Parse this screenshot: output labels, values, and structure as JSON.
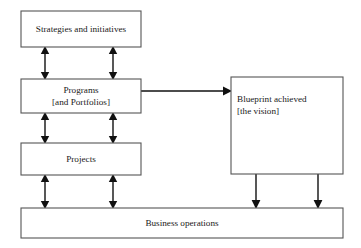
{
  "diagram": {
    "background_color": "#ffffff",
    "box_border_color": "#555555",
    "arrow_color": "#111111",
    "nodes": {
      "strategies": {
        "label": "Strategies and initiatives",
        "lines": [
          "Strategies and initiatives"
        ],
        "x": 21,
        "y": 11,
        "width": 120,
        "height": 36
      },
      "programs": {
        "label": "Programs [and Portfolios]",
        "lines": [
          "Programs",
          "[and Portfolios]"
        ],
        "x": 21,
        "y": 79,
        "width": 120,
        "height": 34
      },
      "projects": {
        "label": "Projects",
        "lines": [
          "Projects"
        ],
        "x": 21,
        "y": 143,
        "width": 120,
        "height": 32
      },
      "blueprint": {
        "label": "Blueprint achieved [the vision]",
        "lines": [
          "Blueprint achieved",
          "[the vision]"
        ],
        "x": 231,
        "y": 77,
        "width": 112,
        "height": 97
      },
      "business_operations": {
        "label": "Business operations",
        "lines": [
          "Business operations"
        ],
        "x": 21,
        "y": 208,
        "width": 322,
        "height": 30
      }
    },
    "connectors": [
      {
        "name": "strategies-programs-left",
        "type": "double-vertical",
        "x": 45,
        "y_top": 47,
        "y_bottom": 79
      },
      {
        "name": "strategies-programs-right",
        "type": "double-vertical",
        "x": 113,
        "y_top": 47,
        "y_bottom": 79
      },
      {
        "name": "programs-projects-left",
        "type": "double-vertical",
        "x": 45,
        "y_top": 113,
        "y_bottom": 143
      },
      {
        "name": "programs-projects-right",
        "type": "double-vertical",
        "x": 113,
        "y_top": 113,
        "y_bottom": 143
      },
      {
        "name": "projects-operations-left",
        "type": "double-vertical",
        "x": 45,
        "y_top": 175,
        "y_bottom": 208
      },
      {
        "name": "projects-operations-right",
        "type": "double-vertical",
        "x": 113,
        "y_top": 175,
        "y_bottom": 208
      },
      {
        "name": "programs-blueprint",
        "type": "single-horizontal-right",
        "y": 91,
        "x_start": 141,
        "x_end": 231
      },
      {
        "name": "blueprint-operations-left",
        "type": "single-vertical-down",
        "x": 256,
        "y_top": 174,
        "y_bottom": 208
      },
      {
        "name": "blueprint-operations-right",
        "type": "single-vertical-down",
        "x": 318,
        "y_top": 174,
        "y_bottom": 208
      }
    ]
  }
}
